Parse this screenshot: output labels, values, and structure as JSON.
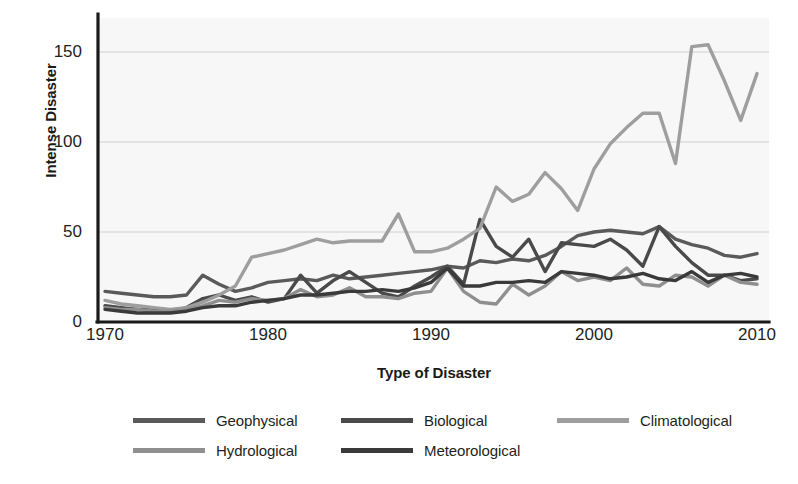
{
  "chart_data": {
    "type": "line",
    "title": "",
    "xlabel": "Type of Disaster",
    "ylabel": "Intense Disaster",
    "xlim": [
      1970,
      2010
    ],
    "ylim": [
      0,
      160
    ],
    "grid": true,
    "legend_position": "bottom",
    "xticks": [
      1970,
      1980,
      1990,
      2000,
      2010
    ],
    "xtick_labels": [
      "1970",
      "1980",
      "1990",
      "2000",
      "2010"
    ],
    "yticks": [
      0,
      50,
      100,
      150
    ],
    "ytick_labels": [
      "0",
      "50",
      "100",
      "150"
    ],
    "x": [
      1970,
      1971,
      1972,
      1973,
      1974,
      1975,
      1976,
      1977,
      1978,
      1979,
      1980,
      1981,
      1982,
      1983,
      1984,
      1985,
      1986,
      1987,
      1988,
      1989,
      1990,
      1991,
      1992,
      1993,
      1994,
      1995,
      1996,
      1997,
      1998,
      1999,
      2000,
      2001,
      2002,
      2003,
      2004,
      2005,
      2006,
      2007,
      2008,
      2009,
      2010
    ],
    "series": [
      {
        "name": "Geophysical",
        "color": "#5a5a5a",
        "values": [
          17,
          16,
          15,
          14,
          14,
          15,
          26,
          21,
          17,
          19,
          22,
          23,
          24,
          23,
          26,
          24,
          25,
          26,
          27,
          28,
          29,
          31,
          30,
          34,
          33,
          35,
          34,
          37,
          42,
          48,
          50,
          51,
          50,
          49,
          53,
          46,
          43,
          41,
          37,
          36,
          38
        ]
      },
      {
        "name": "Biological",
        "color": "#4a4a4a",
        "values": [
          9,
          8,
          7,
          7,
          6,
          8,
          13,
          15,
          12,
          14,
          11,
          13,
          26,
          16,
          23,
          28,
          22,
          16,
          14,
          20,
          25,
          31,
          21,
          57,
          42,
          36,
          46,
          28,
          44,
          43,
          42,
          46,
          40,
          31,
          53,
          42,
          33,
          26,
          26,
          23,
          24
        ]
      },
      {
        "name": "Climatological",
        "color": "#9e9e9e",
        "values": [
          12,
          10,
          9,
          8,
          7,
          8,
          11,
          15,
          20,
          36,
          38,
          40,
          43,
          46,
          44,
          45,
          45,
          45,
          60,
          39,
          39,
          41,
          46,
          52,
          75,
          67,
          71,
          83,
          74,
          62,
          85,
          99,
          108,
          116,
          116,
          88,
          153,
          154,
          134,
          112,
          138
        ]
      },
      {
        "name": "Hydrological",
        "color": "#8f8f8f",
        "values": [
          8,
          7,
          7,
          6,
          6,
          7,
          9,
          12,
          11,
          13,
          12,
          13,
          18,
          14,
          15,
          19,
          14,
          14,
          13,
          16,
          17,
          30,
          17,
          11,
          10,
          21,
          15,
          20,
          28,
          23,
          25,
          23,
          30,
          21,
          20,
          26,
          25,
          20,
          26,
          22,
          21
        ]
      },
      {
        "name": "Meteorological",
        "color": "#3a3a3a",
        "values": [
          7,
          6,
          5,
          5,
          5,
          6,
          8,
          9,
          9,
          11,
          12,
          13,
          15,
          15,
          16,
          17,
          17,
          18,
          17,
          19,
          22,
          30,
          20,
          20,
          22,
          22,
          23,
          22,
          28,
          27,
          26,
          24,
          25,
          27,
          24,
          23,
          28,
          22,
          26,
          27,
          25
        ]
      }
    ]
  },
  "legend": {
    "items": [
      {
        "label": "Geophysical",
        "color": "#5a5a5a"
      },
      {
        "label": "Biological",
        "color": "#4a4a4a"
      },
      {
        "label": "Climatological",
        "color": "#9e9e9e"
      },
      {
        "label": "Hydrological",
        "color": "#8f8f8f"
      },
      {
        "label": "Meteorological",
        "color": "#3a3a3a"
      }
    ]
  },
  "style": {
    "plot_background": "#f7f7f7",
    "grid_color": "#c9c9c9",
    "axis_color": "#1a1a1a",
    "text_color": "#231f20"
  }
}
